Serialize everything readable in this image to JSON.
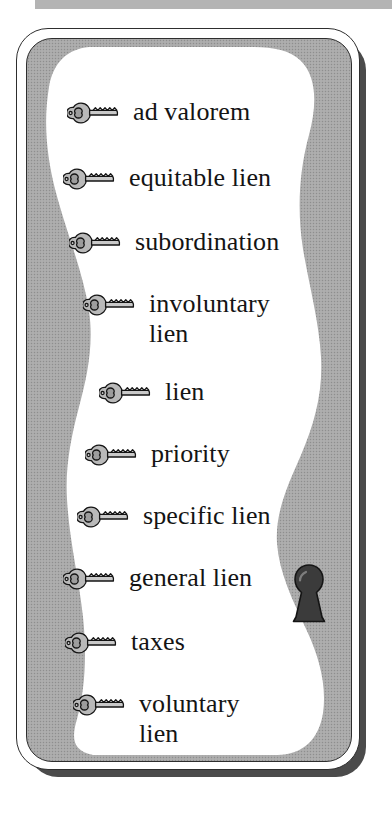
{
  "figure": {
    "kind": "key-terms-vocabulary-card",
    "bullet_icon": "key-icon",
    "decoration_icon": "keyhole-icon"
  },
  "colors": {
    "page_background": "#ffffff",
    "panel_gray": "#a9a9a9",
    "blob_white": "#ffffff",
    "outline_dark": "#2e2e2e",
    "shadow_dark": "#4b4b4b",
    "text": "#141414",
    "key_fill": "#b4b4b4",
    "keyhole_fill": "#3b3b3b"
  },
  "terms": [
    {
      "id": 1,
      "label": "ad valorem",
      "lines": [
        "ad valorem"
      ],
      "key": "key-icon"
    },
    {
      "id": 2,
      "label": "equitable lien",
      "lines": [
        "equitable lien"
      ],
      "key": "key-icon"
    },
    {
      "id": 3,
      "label": "subordination",
      "lines": [
        "subordination"
      ],
      "key": "key-icon"
    },
    {
      "id": 4,
      "label": "involuntary lien",
      "lines": [
        "involuntary",
        "lien"
      ],
      "key": "key-icon"
    },
    {
      "id": 5,
      "label": "lien",
      "lines": [
        "lien"
      ],
      "key": "key-icon"
    },
    {
      "id": 6,
      "label": "priority",
      "lines": [
        "priority"
      ],
      "key": "key-icon"
    },
    {
      "id": 7,
      "label": "specific lien",
      "lines": [
        "specific lien"
      ],
      "key": "key-icon"
    },
    {
      "id": 8,
      "label": "general lien",
      "lines": [
        "general lien"
      ],
      "key": "key-icon"
    },
    {
      "id": 9,
      "label": "taxes",
      "lines": [
        "taxes"
      ],
      "key": "key-icon"
    },
    {
      "id": 10,
      "label": "voluntary lien",
      "lines": [
        "voluntary",
        "lien"
      ],
      "key": "key-icon"
    }
  ]
}
